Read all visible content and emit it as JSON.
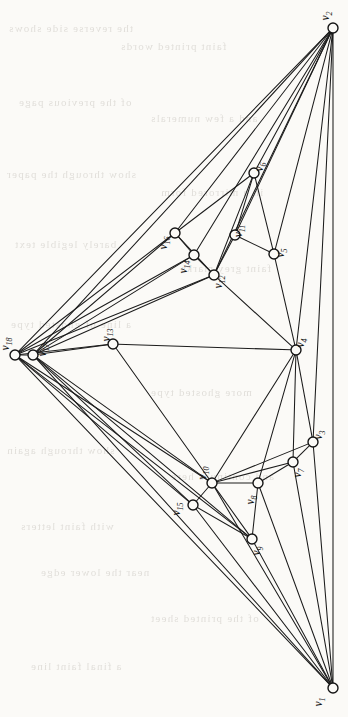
{
  "figure": {
    "kind": "undirected-graph-drawing",
    "title": "",
    "caption": "",
    "background_color": "#fbfaf7",
    "edge_color": "#1c1c1c",
    "node_fill": "#fbfaf7",
    "node_stroke": "#141414",
    "node_count": 18,
    "edge_count": 57
  },
  "chart_data": {
    "type": "graph",
    "title": "",
    "xlabel": "",
    "ylabel": "",
    "directed": false,
    "node_radius": 5,
    "nodes": [
      {
        "id": "v1",
        "label": "v",
        "sub": "1",
        "x": 333,
        "y": 688,
        "label_dx": -11,
        "label_dy": 14
      },
      {
        "id": "v2",
        "label": "v",
        "sub": "2",
        "x": 333,
        "y": 28,
        "label_dx": -4,
        "label_dy": -12
      },
      {
        "id": "v3",
        "label": "v",
        "sub": "3",
        "x": 313,
        "y": 442,
        "label_dx": 9,
        "label_dy": -7
      },
      {
        "id": "v4",
        "label": "v",
        "sub": "4",
        "x": 296,
        "y": 350,
        "label_dx": 8,
        "label_dy": -7
      },
      {
        "id": "v5",
        "label": "v",
        "sub": "5",
        "x": 274,
        "y": 254,
        "label_dx": 10,
        "label_dy": -1
      },
      {
        "id": "v6",
        "label": "v",
        "sub": "6",
        "x": 254,
        "y": 173,
        "label_dx": 9,
        "label_dy": -6
      },
      {
        "id": "v7",
        "label": "v",
        "sub": "7",
        "x": 293,
        "y": 462,
        "label_dx": 8,
        "label_dy": 11
      },
      {
        "id": "v8",
        "label": "v",
        "sub": "8",
        "x": 258,
        "y": 483,
        "label_dx": -4,
        "label_dy": 17
      },
      {
        "id": "v9",
        "label": "v",
        "sub": "9",
        "x": 252,
        "y": 539,
        "label_dx": 8,
        "label_dy": 12
      },
      {
        "id": "v10",
        "label": "v",
        "sub": "10",
        "x": 212,
        "y": 483,
        "label_dx": -6,
        "label_dy": -10
      },
      {
        "id": "v11",
        "label": "v",
        "sub": "11",
        "x": 235,
        "y": 235,
        "label_dx": 7,
        "label_dy": -4
      },
      {
        "id": "v12",
        "label": "v",
        "sub": "12",
        "x": 214,
        "y": 275,
        "label_dx": 8,
        "label_dy": 7
      },
      {
        "id": "v13",
        "label": "v",
        "sub": "13",
        "x": 113,
        "y": 344,
        "label_dx": -3,
        "label_dy": -9
      },
      {
        "id": "v14",
        "label": "v",
        "sub": "14",
        "x": 194,
        "y": 255,
        "label_dx": -7,
        "label_dy": 12
      },
      {
        "id": "v15",
        "label": "v",
        "sub": "15",
        "x": 193,
        "y": 505,
        "label_dx": -13,
        "label_dy": 4
      },
      {
        "id": "v16",
        "label": "v",
        "sub": "16",
        "x": 175,
        "y": 233,
        "label_dx": -8,
        "label_dy": 10
      },
      {
        "id": "v17",
        "label": "v",
        "sub": "17",
        "x": 33,
        "y": 355,
        "label_dx": 13,
        "label_dy": -5
      },
      {
        "id": "v18",
        "label": "v",
        "sub": "18",
        "x": 15,
        "y": 355,
        "label_dx": -6,
        "label_dy": -11
      }
    ],
    "edges": [
      [
        "v2",
        "v6"
      ],
      [
        "v2",
        "v5"
      ],
      [
        "v2",
        "v11"
      ],
      [
        "v2",
        "v12"
      ],
      [
        "v2",
        "v14"
      ],
      [
        "v2",
        "v16"
      ],
      [
        "v2",
        "v17"
      ],
      [
        "v2",
        "v4"
      ],
      [
        "v2",
        "v3"
      ],
      [
        "v2",
        "v1"
      ],
      [
        "v6",
        "v5"
      ],
      [
        "v6",
        "v11"
      ],
      [
        "v6",
        "v12"
      ],
      [
        "v6",
        "v16"
      ],
      [
        "v5",
        "v11"
      ],
      [
        "v5",
        "v4"
      ],
      [
        "v11",
        "v12"
      ],
      [
        "v12",
        "v14"
      ],
      [
        "v12",
        "v16"
      ],
      [
        "v12",
        "v17"
      ],
      [
        "v12",
        "v4"
      ],
      [
        "v14",
        "v16"
      ],
      [
        "v14",
        "v12"
      ],
      [
        "v14",
        "v17"
      ],
      [
        "v16",
        "v17"
      ],
      [
        "v17",
        "v18"
      ],
      [
        "v17",
        "v13"
      ],
      [
        "v17",
        "v10"
      ],
      [
        "v17",
        "v15"
      ],
      [
        "v17",
        "v9"
      ],
      [
        "v17",
        "v1"
      ],
      [
        "v18",
        "v2"
      ],
      [
        "v18",
        "v16"
      ],
      [
        "v18",
        "v14"
      ],
      [
        "v18",
        "v12"
      ],
      [
        "v18",
        "v13"
      ],
      [
        "v18",
        "v15"
      ],
      [
        "v18",
        "v10"
      ],
      [
        "v18",
        "v9"
      ],
      [
        "v18",
        "v1"
      ],
      [
        "v13",
        "v4"
      ],
      [
        "v13",
        "v10"
      ],
      [
        "v4",
        "v12"
      ],
      [
        "v4",
        "v10"
      ],
      [
        "v4",
        "v3"
      ],
      [
        "v4",
        "v7"
      ],
      [
        "v4",
        "v8"
      ],
      [
        "v10",
        "v15"
      ],
      [
        "v10",
        "v8"
      ],
      [
        "v10",
        "v7"
      ],
      [
        "v10",
        "v3"
      ],
      [
        "v10",
        "v9"
      ],
      [
        "v10",
        "v1"
      ],
      [
        "v8",
        "v7"
      ],
      [
        "v8",
        "v9"
      ],
      [
        "v8",
        "v1"
      ],
      [
        "v7",
        "v3"
      ],
      [
        "v7",
        "v1"
      ],
      [
        "v3",
        "v1"
      ],
      [
        "v9",
        "v1"
      ],
      [
        "v15",
        "v9"
      ],
      [
        "v15",
        "v1"
      ]
    ],
    "legend": [],
    "annotations": []
  },
  "page_bleed": {
    "visible": true,
    "note": "faint mirrored show-through text from the reverse side of the printed page",
    "lines": [
      {
        "text": "the reverse side shows",
        "x": 8,
        "y": 22
      },
      {
        "text": "faint printed words",
        "x": 120,
        "y": 40
      },
      {
        "text": "of the previous page",
        "x": 18,
        "y": 96
      },
      {
        "text": "and a few numerals",
        "x": 150,
        "y": 112
      },
      {
        "text": "show through the paper",
        "x": 6,
        "y": 168
      },
      {
        "text": "in a mirrored form",
        "x": 160,
        "y": 186
      },
      {
        "text": "barely legible text",
        "x": 14,
        "y": 238
      },
      {
        "text": "faint grey marks",
        "x": 180,
        "y": 262
      },
      {
        "text": "a line of ghosted type",
        "x": 10,
        "y": 318
      },
      {
        "text": "more ghosted type",
        "x": 150,
        "y": 386
      },
      {
        "text": "show through again",
        "x": 6,
        "y": 444
      },
      {
        "text": "and continues here",
        "x": 170,
        "y": 470
      },
      {
        "text": "with faint letters",
        "x": 20,
        "y": 520
      },
      {
        "text": "near the lower edge",
        "x": 40,
        "y": 566
      },
      {
        "text": "of the printed sheet",
        "x": 150,
        "y": 612
      },
      {
        "text": "a final faint line",
        "x": 30,
        "y": 660
      }
    ]
  }
}
